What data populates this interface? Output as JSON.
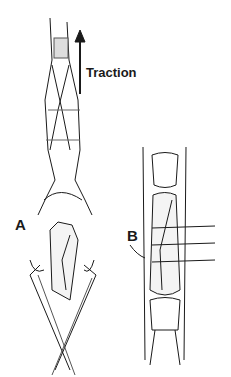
{
  "figure": {
    "labels": {
      "traction": "Traction",
      "panel_a": "A",
      "panel_b": "B"
    },
    "panels": [
      {
        "id": "A",
        "description": "Finger with tendon traction and clamps holding fractured phalanx"
      },
      {
        "id": "B",
        "description": "Fractured phalanx fixed with transverse pins"
      }
    ],
    "colors": {
      "ink": "#1a1a1a",
      "background": "#ffffff"
    }
  }
}
